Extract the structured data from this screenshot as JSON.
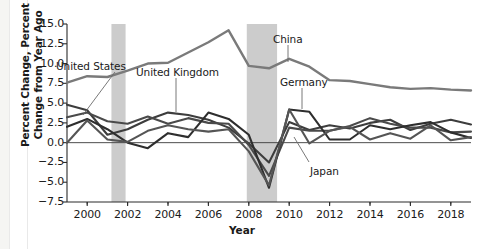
{
  "chart_data": {
    "type": "line",
    "title": "",
    "xlabel": "Year",
    "ylabel": "Percent Change, Percent Change from Year Ago",
    "ylabel_line1": "Percent Change, Percent",
    "ylabel_line2": "Change from Year Ago",
    "xlim": [
      1999,
      2019
    ],
    "ylim": [
      -7.5,
      15.0
    ],
    "yticks": [
      "15.0",
      "12.5",
      "10.0",
      "7.5",
      "5.0",
      "2.5",
      "0.0",
      "−2.5",
      "−5.0",
      "−7.5"
    ],
    "ytick_values": [
      15.0,
      12.5,
      10.0,
      7.5,
      5.0,
      2.5,
      0.0,
      -2.5,
      -5.0,
      -7.5
    ],
    "xticks": [
      "2000",
      "2002",
      "2004",
      "2006",
      "2008",
      "2010",
      "2012",
      "2014",
      "2016",
      "2018"
    ],
    "xtick_values": [
      2000,
      2002,
      2004,
      2006,
      2008,
      2010,
      2012,
      2014,
      2016,
      2018
    ],
    "grid": false,
    "legend": "inline-annotations",
    "zero_line": 0.0,
    "recession_bands": [
      {
        "start": 2001.2,
        "end": 2001.9,
        "color": "#cccccc"
      },
      {
        "start": 2007.9,
        "end": 2009.4,
        "color": "#cccccc"
      }
    ],
    "x": [
      1999,
      2000,
      2001,
      2002,
      2003,
      2004,
      2005,
      2006,
      2007,
      2008,
      2009,
      2010,
      2011,
      2012,
      2013,
      2014,
      2015,
      2016,
      2017,
      2018,
      2019
    ],
    "series": [
      {
        "name": "China",
        "color": "#7a7a7a",
        "width": 2.4,
        "values": [
          7.6,
          8.4,
          8.3,
          9.1,
          10.0,
          10.1,
          11.4,
          12.7,
          14.2,
          9.7,
          9.4,
          10.6,
          9.6,
          7.9,
          7.8,
          7.4,
          7.0,
          6.8,
          6.9,
          6.7,
          6.6
        ]
      },
      {
        "name": "United States",
        "color": "#3d3d3d",
        "width": 2.1,
        "values": [
          4.8,
          4.1,
          1.0,
          1.7,
          2.9,
          3.8,
          3.5,
          2.9,
          1.9,
          -0.1,
          -2.5,
          2.6,
          1.6,
          2.2,
          1.8,
          2.5,
          2.9,
          1.6,
          2.4,
          2.9,
          2.3
        ]
      },
      {
        "name": "United Kingdom",
        "color": "#4a4a4a",
        "width": 2.1,
        "values": [
          3.2,
          3.8,
          2.7,
          2.4,
          3.3,
          2.4,
          3.1,
          2.5,
          2.4,
          -0.3,
          -4.2,
          1.9,
          1.5,
          1.5,
          2.1,
          3.1,
          2.4,
          1.9,
          1.9,
          1.3,
          1.4
        ]
      },
      {
        "name": "Germany",
        "color": "#2e2e2e",
        "width": 2.1,
        "values": [
          2.0,
          3.0,
          1.7,
          0.0,
          -0.7,
          1.2,
          0.7,
          3.8,
          3.0,
          1.0,
          -5.7,
          4.2,
          3.9,
          0.4,
          0.4,
          2.2,
          1.7,
          2.2,
          2.6,
          1.3,
          0.6
        ]
      },
      {
        "name": "Japan",
        "color": "#555555",
        "width": 2.1,
        "values": [
          0.0,
          2.8,
          0.4,
          0.1,
          1.5,
          2.2,
          1.7,
          1.4,
          1.7,
          -1.1,
          -5.4,
          4.2,
          -0.1,
          1.5,
          2.0,
          0.4,
          1.2,
          0.5,
          2.2,
          0.3,
          0.7
        ]
      }
    ],
    "annotations": [
      {
        "text": "United States",
        "x_px": 56,
        "y_px": 60,
        "leader": {
          "x1": 115,
          "y1": 72,
          "x2": 83,
          "y2": 115
        }
      },
      {
        "text": "United Kingdom",
        "x_px": 136,
        "y_px": 66,
        "leader": {
          "x1": 176,
          "y1": 78,
          "x2": 176,
          "y2": 112
        }
      },
      {
        "text": "China",
        "x_px": 273,
        "y_px": 33,
        "leader": {
          "x1": 288,
          "y1": 45,
          "x2": 288,
          "y2": 62
        }
      },
      {
        "text": "Germany",
        "x_px": 280,
        "y_px": 76,
        "leader": {
          "x1": 302,
          "y1": 88,
          "x2": 302,
          "y2": 109
        }
      },
      {
        "text": "Japan",
        "x_px": 310,
        "y_px": 165,
        "leader": {
          "x1": 309,
          "y1": 162,
          "x2": 294,
          "y2": 137
        }
      }
    ]
  }
}
